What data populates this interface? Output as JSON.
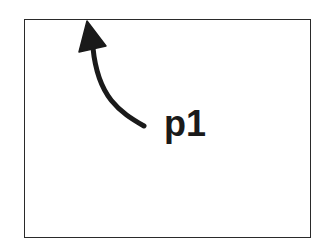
{
  "diagram": {
    "frame": {
      "shape": "rectangle",
      "stroke_color": "#2a2a2a"
    },
    "arrow": {
      "icon": "curved-arrow-icon",
      "direction": "up-left",
      "points_to": "top edge of frame",
      "color": "#1a1a1a"
    },
    "label": {
      "text": "p1",
      "color": "#1a1a1a"
    }
  }
}
